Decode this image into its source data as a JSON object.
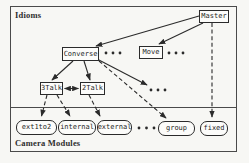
{
  "diagram": {
    "regions": {
      "idioms": "Idioms",
      "camera_modules": "Camera Modules"
    },
    "idioms": {
      "master": "Master",
      "converse": "Converse",
      "move": "Move",
      "talk3": "3Talk",
      "talk2": "2Talk"
    },
    "camera_modules": {
      "ext1to2": "ext1to2",
      "internal": "internal",
      "external": "external",
      "group": "group",
      "fixed": "fixed"
    },
    "edges": [
      {
        "from": "Master",
        "to": "Converse",
        "style": "solid"
      },
      {
        "from": "Master",
        "to": "Move",
        "style": "solid"
      },
      {
        "from": "Master",
        "to": "fixed",
        "style": "dashed"
      },
      {
        "from": "Converse",
        "to": "3Talk",
        "style": "solid"
      },
      {
        "from": "Converse",
        "to": "2Talk",
        "style": "solid"
      },
      {
        "from": "Converse",
        "to": "ellipsis",
        "style": "solid"
      },
      {
        "from": "Converse",
        "to": "group",
        "style": "dashed"
      },
      {
        "from": "3Talk",
        "to": "2Talk",
        "style": "solid-bidirectional"
      },
      {
        "from": "3Talk",
        "to": "ext1to2",
        "style": "dashed"
      },
      {
        "from": "3Talk",
        "to": "internal",
        "style": "dashed"
      },
      {
        "from": "2Talk",
        "to": "external",
        "style": "dashed"
      }
    ],
    "colors": {
      "line": "#2b2b2b",
      "background": "#f7f7f4",
      "node_fill": "#fcfcfa"
    }
  }
}
